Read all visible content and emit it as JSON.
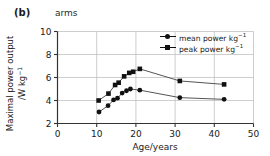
{
  "panel": {
    "label": "(b)",
    "subtitle": "arms"
  },
  "axes": {
    "ylabel_line1": "Maximal power output",
    "ylabel_line2_pre": "/W kg",
    "ylabel_line2_sup": "−1",
    "xlabel": "Age/years"
  },
  "legend": {
    "items": [
      {
        "label_pre": "mean power kg",
        "label_sup": "−1",
        "marker": "circle"
      },
      {
        "label_pre": "peak power kg",
        "label_sup": "−1",
        "marker": "square"
      }
    ]
  },
  "chart_data": {
    "type": "line",
    "title": "arms",
    "xlabel": "Age/years",
    "ylabel": "Maximal power output /W kg−1",
    "xlim": [
      0,
      50
    ],
    "ylim": [
      2,
      10
    ],
    "xticks": [
      0,
      10,
      20,
      30,
      40,
      50
    ],
    "yticks": [
      2,
      4,
      6,
      8,
      10
    ],
    "xtick_labels": [
      "0",
      "10",
      "20",
      "30",
      "40",
      "50"
    ],
    "ytick_labels": [
      "2",
      "4",
      "6",
      "8",
      "10"
    ],
    "grid": true,
    "legend_position": "upper right",
    "series": [
      {
        "name": "peak power kg−1",
        "marker": "square",
        "color": "#111111",
        "points": [
          [
            10.5,
            4.0
          ],
          [
            13.0,
            4.6
          ],
          [
            14.7,
            5.35
          ],
          [
            15.6,
            5.55
          ],
          [
            17.0,
            6.1
          ],
          [
            18.3,
            6.4
          ],
          [
            19.3,
            6.5
          ],
          [
            21.0,
            6.75
          ],
          [
            31.2,
            5.7
          ],
          [
            42.5,
            5.4
          ]
        ]
      },
      {
        "name": "mean power kg−1",
        "marker": "circle",
        "color": "#111111",
        "points": [
          [
            10.6,
            3.0
          ],
          [
            12.9,
            3.55
          ],
          [
            14.3,
            4.05
          ],
          [
            15.3,
            4.2
          ],
          [
            16.5,
            4.65
          ],
          [
            17.6,
            4.85
          ],
          [
            18.6,
            5.0
          ],
          [
            21.0,
            4.9
          ],
          [
            31.2,
            4.25
          ],
          [
            42.5,
            4.1
          ]
        ]
      }
    ]
  },
  "style": {
    "axis_color": "#333333",
    "grid_color": "#b9b9b9",
    "line_color": "#555555",
    "marker_color": "#111111",
    "text_color": "#1a1a1a",
    "background": "#ffffff"
  }
}
